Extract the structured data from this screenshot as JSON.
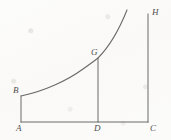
{
  "figure": {
    "kind": "geometric-diagram",
    "colors": {
      "background": "#fbfbf9",
      "stroke": "#6a6a6a",
      "label": "#4e4e4e"
    },
    "points": [
      {
        "key": "A",
        "label": "A",
        "x": 21,
        "y": 122,
        "label_x": 16,
        "label_y": 124
      },
      {
        "key": "B",
        "label": "B",
        "x": 21,
        "y": 96,
        "label_x": 13,
        "label_y": 86
      },
      {
        "key": "G",
        "label": "G",
        "x": 98,
        "y": 58,
        "label_x": 91,
        "label_y": 48
      },
      {
        "key": "D",
        "label": "D",
        "x": 98,
        "y": 122,
        "label_x": 94,
        "label_y": 124
      },
      {
        "key": "C",
        "label": "C",
        "x": 148,
        "y": 122,
        "label_x": 150,
        "label_y": 124
      },
      {
        "key": "H",
        "label": "H",
        "x": 148,
        "y": 14,
        "label_x": 152,
        "label_y": 8
      }
    ],
    "segments": [
      {
        "name": "base-line-AC",
        "from": "A",
        "to": "C",
        "x1": 21,
        "y1": 122,
        "x2": 148,
        "y2": 122
      },
      {
        "name": "left-ordinate-AB",
        "from": "A",
        "to": "B",
        "x1": 21,
        "y1": 122,
        "x2": 21,
        "y2": 96
      },
      {
        "name": "mid-ordinate-DG",
        "from": "D",
        "to": "G",
        "x1": 98,
        "y1": 122,
        "x2": 98,
        "y2": 58
      },
      {
        "name": "right-ordinate-CH",
        "from": "C",
        "to": "H",
        "x1": 148,
        "y1": 122,
        "x2": 148,
        "y2": 14
      }
    ],
    "curve": {
      "name": "exponential-curve-BGH",
      "start": {
        "x": 21,
        "y": 96
      },
      "through": {
        "x": 98,
        "y": 58
      },
      "end": {
        "x": 127,
        "y": 10
      },
      "path": "M 21 96 C 45 91, 68 80, 83 69 C 93 62, 98 58, 98 58 C 109 47, 119 30, 127 10"
    }
  }
}
